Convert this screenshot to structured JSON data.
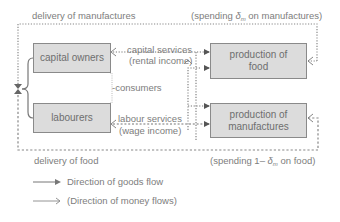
{
  "diagram": {
    "nodes": {
      "capital_owners": "capital owners",
      "labourers": "labourers",
      "production_food_line1": "production of",
      "production_food_line2": "food",
      "production_manufactures_line1": "production of",
      "production_manufactures_line2": "manufactures"
    },
    "labels": {
      "delivery_manufactures": "delivery of manufactures",
      "spending_manufactures_prefix": "(spending ",
      "spending_manufactures_symbol": "δ",
      "spending_manufactures_sub": "m",
      "spending_manufactures_suffix": " on manufactures)",
      "capital_services": "capital services",
      "rental_income": "(rental income)",
      "consumers": "-consumers",
      "labour_services": "labour services",
      "wage_income": "(wage income)",
      "delivery_food": "delivery of food",
      "spending_food_prefix": "(spending 1– ",
      "spending_food_symbol": "δ",
      "spending_food_sub": "m",
      "spending_food_suffix": " on food)"
    },
    "legend": {
      "goods_flow": "Direction of goods flow",
      "money_flow": "(Direction of money flows)"
    },
    "colors": {
      "box_fill": "#dcdcdc",
      "box_border": "#8a8a8a",
      "line": "#7a7a7a",
      "text": "#7d7d7d"
    }
  }
}
